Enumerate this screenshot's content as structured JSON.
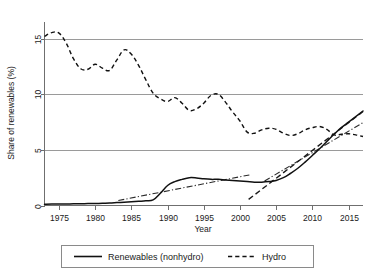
{
  "chart_data": {
    "type": "line",
    "title": "",
    "xlabel": "Year",
    "ylabel": "Share of renewables (%)",
    "xlim": [
      1973,
      2017
    ],
    "ylim": [
      0,
      16.5
    ],
    "xticks": [
      1975,
      1980,
      1985,
      1990,
      1995,
      2000,
      2005,
      2010,
      2015
    ],
    "yticks": [
      0,
      5,
      10,
      15
    ],
    "grid": "horizontal",
    "legend_position": "bottom-center",
    "x": [
      1973,
      1974,
      1975,
      1976,
      1977,
      1978,
      1979,
      1980,
      1981,
      1982,
      1983,
      1984,
      1985,
      1986,
      1987,
      1988,
      1989,
      1990,
      1991,
      1992,
      1993,
      1994,
      1995,
      1996,
      1997,
      1998,
      1999,
      2000,
      2001,
      2002,
      2003,
      2004,
      2005,
      2006,
      2007,
      2008,
      2009,
      2010,
      2011,
      2012,
      2013,
      2014,
      2015,
      2016,
      2017
    ],
    "series": [
      {
        "name": "Renewables (nonhydro)",
        "style": "solid",
        "values": [
          0.12,
          0.13,
          0.13,
          0.14,
          0.15,
          0.16,
          0.17,
          0.18,
          0.2,
          0.22,
          0.26,
          0.3,
          0.34,
          0.38,
          0.42,
          0.5,
          1.1,
          1.8,
          2.15,
          2.35,
          2.5,
          2.48,
          2.4,
          2.35,
          2.35,
          2.3,
          2.25,
          2.2,
          2.15,
          2.1,
          2.1,
          2.15,
          2.25,
          2.5,
          2.9,
          3.35,
          3.9,
          4.5,
          5.1,
          5.75,
          6.4,
          7.0,
          7.5,
          8.0,
          8.5
        ]
      },
      {
        "name": "Hydro",
        "style": "dashed",
        "values": [
          15.2,
          15.55,
          15.5,
          14.6,
          13.2,
          12.3,
          12.25,
          12.7,
          12.35,
          12.15,
          13.1,
          14.0,
          13.6,
          12.6,
          11.3,
          10.1,
          9.6,
          9.35,
          9.7,
          9.2,
          8.55,
          8.7,
          9.2,
          9.9,
          10.0,
          9.3,
          8.4,
          7.6,
          6.6,
          6.5,
          6.8,
          6.95,
          6.85,
          6.5,
          6.3,
          6.45,
          6.8,
          7.0,
          7.1,
          6.85,
          6.35,
          6.4,
          6.45,
          6.35,
          6.2
        ]
      }
    ],
    "trend_segments": [
      {
        "name": "renewables-early-trend",
        "style": "dash-dot",
        "x": [
          1983.2,
          2001.3
        ],
        "y": [
          0.45,
          2.75
        ]
      },
      {
        "name": "renewables-late-trend",
        "style": "dash-dot",
        "x": [
          2003.4,
          2017.0
        ],
        "y": [
          2.2,
          7.45
        ]
      },
      {
        "name": "hydro-late-trend",
        "style": "dashed",
        "x": [
          2001.2,
          2017.0
        ],
        "y": [
          0.55,
          8.45
        ]
      }
    ]
  },
  "legend": {
    "entries": [
      {
        "label": "Renewables (nonhydro)",
        "key": "solid-line-key"
      },
      {
        "label": "Hydro",
        "key": "dashed-line-key"
      }
    ]
  },
  "axes": {
    "y_title": "Share of renewables (%)",
    "x_title": "Year",
    "y_tick_labels": [
      "0",
      "5",
      "10",
      "15"
    ],
    "x_tick_labels": [
      "1975",
      "1980",
      "1985",
      "1990",
      "1995",
      "2000",
      "2005",
      "2010",
      "2015"
    ]
  },
  "colors": {
    "line": "#111111",
    "grid": "#9a9a9a",
    "axis": "#6f6f6f",
    "text": "#1a1a1a",
    "background": "#ffffff"
  }
}
